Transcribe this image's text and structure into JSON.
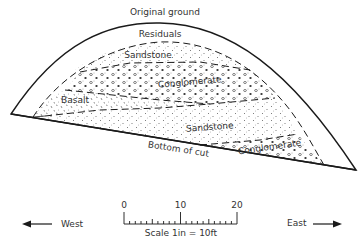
{
  "diagram": {
    "labels": {
      "original_ground": "Original ground",
      "residuals": "Residuals",
      "sandstone_upper": "Sandstone",
      "conglomerate_upper": "Conglomerate",
      "basalt": "Basalt",
      "sandstone_lower": "Sandstone",
      "conglomerate_lower": "Conglomerate",
      "bottom_of_cut": "Bottom of cut"
    },
    "layers": [
      "Residuals",
      "Sandstone",
      "Conglomerate",
      "Basalt",
      "Sandstone",
      "Conglomerate"
    ]
  },
  "directions": {
    "west": "West",
    "east": "East"
  },
  "scale": {
    "ticks": [
      "0",
      "10",
      "20"
    ],
    "caption": "Scale 1in = 10ft"
  },
  "colors": {
    "line": "#1a1a1a",
    "background": "#ffffff"
  }
}
